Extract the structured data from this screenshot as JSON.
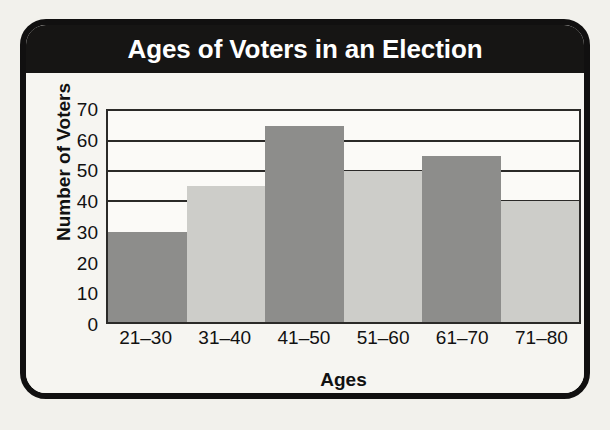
{
  "card": {
    "title": "Ages of Voters in an Election"
  },
  "chart_data": {
    "type": "bar",
    "title": "Ages of Voters in an Election",
    "xlabel": "Ages",
    "ylabel": "Number of Voters",
    "categories": [
      "21–30",
      "31–40",
      "41–50",
      "51–60",
      "61–70",
      "71–80"
    ],
    "values": [
      30,
      45,
      65,
      50,
      55,
      40
    ],
    "bar_colors": [
      "#8d8d8b",
      "#cdcdc9",
      "#8d8d8b",
      "#cdcdc9",
      "#8d8d8b",
      "#cdcdc9"
    ],
    "ylim": [
      0,
      70
    ],
    "yticks": [
      70,
      60,
      50,
      40,
      30,
      20,
      10,
      0
    ],
    "ytick_labels": [
      "70",
      "60",
      "50",
      "40",
      "30",
      "20",
      "10",
      "0"
    ],
    "gridlines": [
      60,
      50,
      40
    ],
    "grid": true,
    "legend": false,
    "bar_gap": 0,
    "colors": {
      "banner": "#161514",
      "banner_text": "#ffffff",
      "page_background": "#f2f1ec",
      "card_background": "#f6f5f1",
      "card_border": "#111010",
      "axis": "#2b2a28",
      "bar_dark": "#8d8d8b",
      "bar_light": "#cdcdc9"
    }
  }
}
